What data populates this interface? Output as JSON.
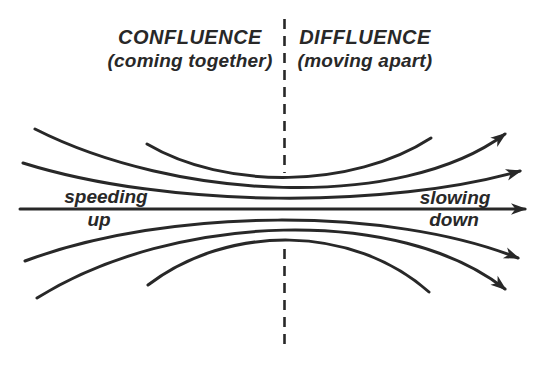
{
  "figure": {
    "type": "streamline-flow-diagram",
    "background_color": "#ffffff",
    "ink_color": "#282828",
    "left_header": {
      "title": "CONFLUENCE",
      "subtitle": "(coming together)"
    },
    "right_header": {
      "title": "DIFFLUENCE",
      "subtitle": "(moving apart)"
    },
    "left_annotation": {
      "line1": "speeding",
      "line2": "up"
    },
    "right_annotation": {
      "line1": "slowing",
      "line2": "down"
    },
    "divider": {
      "style": "vertical-dashed-line",
      "separates": "confluence | diffluence"
    },
    "streamline_count": 7,
    "arrowhead_count": 5,
    "flow_direction": "left-to-right"
  }
}
